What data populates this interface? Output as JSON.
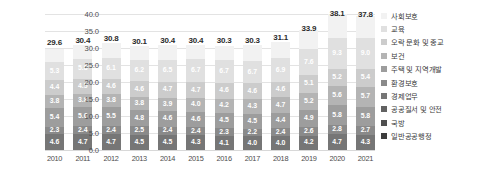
{
  "chart_data": {
    "type": "bar",
    "stacked": true,
    "title": "",
    "subtitle": "",
    "xlabel": "",
    "ylabel": "",
    "ylim": [
      0.0,
      40.0
    ],
    "yticks": [
      "0.0",
      "5.0",
      "10.0",
      "15.0",
      "20.0",
      "25.0",
      "30.0",
      "35.0",
      "40.0"
    ],
    "ytick_values": [
      0.0,
      5.0,
      10.0,
      15.0,
      20.0,
      25.0,
      30.0,
      35.0,
      40.0
    ],
    "grid": true,
    "legend_position": "right",
    "categories": [
      "2010",
      "2011",
      "2012",
      "2013",
      "2014",
      "2015",
      "2016",
      "2017",
      "2018",
      "2019",
      "2020",
      "2021"
    ],
    "totals": [
      29.6,
      30.4,
      30.8,
      30.1,
      30.4,
      30.4,
      30.3,
      30.3,
      31.1,
      33.9,
      38.1,
      37.8
    ],
    "total_labels": [
      "29.6",
      "30.4",
      "30.8",
      "30.1",
      "30.4",
      "30.4",
      "30.3",
      "30.3",
      "31.1",
      "33.9",
      "38.1",
      "37.8"
    ],
    "series": [
      {
        "name": "사회보호",
        "color": "#f2f2f2",
        "text_color": "#ffffff",
        "values": [
          3.9,
          4.1,
          4.3,
          4.3,
          4.3,
          4.2,
          4.3,
          4.5,
          4.8,
          5.6,
          7.0,
          6.6
        ],
        "labels": [
          "",
          "",
          "",
          "",
          "",
          "",
          "",
          "",
          "",
          "",
          "",
          ""
        ]
      },
      {
        "name": "교육",
        "color": "#e0e0e0",
        "text_color": "#ffffff",
        "values": [
          5.3,
          5.8,
          6.1,
          6.2,
          6.5,
          6.7,
          6.7,
          6.7,
          6.9,
          7.6,
          9.3,
          9.0
        ],
        "labels": [
          "5.3",
          "5.8",
          "6.1",
          "6.2",
          "6.5",
          "6.7",
          "6.7",
          "6.7",
          "6.9",
          "7.6",
          "9.3",
          "9.0"
        ]
      },
      {
        "name": "오락 문화 및 종교",
        "color": "#cccccc",
        "text_color": "#ffffff",
        "values": [
          4.4,
          4.5,
          4.6,
          4.6,
          4.7,
          4.7,
          4.6,
          4.6,
          4.6,
          5.1,
          5.2,
          5.4
        ],
        "labels": [
          "4.4",
          "4.5",
          "4.6",
          "4.6",
          "4.7",
          "4.7",
          "4.6",
          "4.6",
          "4.6",
          "5.1",
          "5.2",
          "5.4"
        ]
      },
      {
        "name": "보건",
        "color": "#b4b4b4",
        "text_color": "#ffffff",
        "values": [
          3.8,
          3.8,
          3.8,
          3.8,
          3.9,
          4.0,
          4.2,
          4.3,
          4.7,
          5.2,
          5.6,
          5.7
        ],
        "labels": [
          "3.8",
          "3.8",
          "3.8",
          "3.8",
          "3.9",
          "4.0",
          "4.2",
          "4.3",
          "4.7",
          "5.2",
          "5.6",
          "5.7"
        ]
      },
      {
        "name": "주택 및 지역개발",
        "color": "#9d9d9d",
        "text_color": "#ffffff",
        "values": [
          5.4,
          5.6,
          5.5,
          4.8,
          4.6,
          4.6,
          4.5,
          4.5,
          4.4,
          4.9,
          5.8,
          5.8
        ],
        "labels": [
          "5.4",
          "5.6",
          "5.5",
          "4.8",
          "4.6",
          "4.6",
          "4.5",
          "4.5",
          "4.4",
          "4.9",
          "5.8",
          "5.8"
        ]
      },
      {
        "name": "환경보호",
        "color": "#8a8a8a",
        "text_color": "#ffffff",
        "values": [
          2.3,
          2.4,
          2.4,
          2.5,
          2.4,
          2.4,
          2.3,
          2.2,
          2.4,
          2.6,
          2.8,
          2.7
        ],
        "labels": [
          "2.3",
          "2.4",
          "2.4",
          "2.5",
          "2.4",
          "2.4",
          "2.3",
          "2.2",
          "2.4",
          "2.6",
          "2.8",
          "2.7"
        ]
      },
      {
        "name": "경제업무",
        "color": "#767676",
        "text_color": "#ffffff",
        "values": [
          4.6,
          4.7,
          4.7,
          4.5,
          4.5,
          4.3,
          4.1,
          4.0,
          4.0,
          4.2,
          4.7,
          4.3
        ],
        "labels": [
          "4.6",
          "4.7",
          "4.7",
          "4.5",
          "4.5",
          "4.3",
          "4.1",
          "4.0",
          "4.0",
          "4.2",
          "4.7",
          "4.3"
        ]
      },
      {
        "name": "공공질서 및 안전",
        "color": "#626262",
        "text_color": "#ffffff",
        "values": [
          0.0,
          0.0,
          0.0,
          0.0,
          0.0,
          0.0,
          0.0,
          0.0,
          0.0,
          0.0,
          0.0,
          0.0
        ],
        "labels": [
          "",
          "",
          "",
          "",
          "",
          "",
          "",
          "",
          "",
          "",
          "",
          ""
        ]
      },
      {
        "name": "국방",
        "color": "#4f4f4f",
        "text_color": "#ffffff",
        "values": [
          0.0,
          0.0,
          0.0,
          0.0,
          0.0,
          0.0,
          0.0,
          0.0,
          0.0,
          0.0,
          0.0,
          0.0
        ],
        "labels": [
          "",
          "",
          "",
          "",
          "",
          "",
          "",
          "",
          "",
          "",
          "",
          ""
        ]
      },
      {
        "name": "일반공공행정",
        "color": "#3d3d3d",
        "text_color": "#ffffff",
        "values": [
          0.0,
          0.0,
          0.0,
          0.0,
          0.0,
          0.0,
          0.0,
          0.0,
          0.0,
          0.0,
          0.0,
          0.0
        ],
        "labels": [
          "",
          "",
          "",
          "",
          "",
          "",
          "",
          "",
          "",
          "",
          "",
          ""
        ]
      }
    ]
  }
}
